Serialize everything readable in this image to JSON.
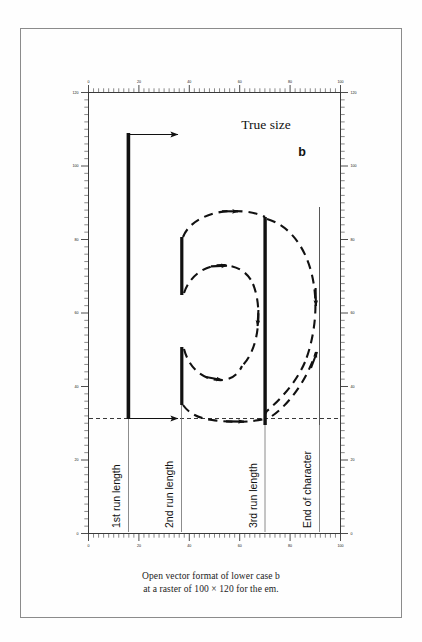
{
  "document": {
    "kind": "figure-page",
    "caption_line_1": "Open vector format of lower case b",
    "caption_line_2": "at a raster of 100 × 120 for the em."
  },
  "figure": {
    "annotations": {
      "true_size": "True size",
      "glyph_sample": "b"
    },
    "run_labels": [
      "1st run length",
      "2nd run length",
      "3rd run length",
      "End of character"
    ],
    "colors": {
      "ink": "#111111",
      "rule": "#3a3a3a",
      "frame": "#8b8b8b",
      "guide": "#6f6f6f",
      "paper": "#fefefe"
    }
  },
  "chart_data": {
    "type": "diagram",
    "title": "Open vector format of lower case b",
    "subtitle": "at a raster of 100 × 120 for the em.",
    "xlabel": "",
    "ylabel": "",
    "grid": false,
    "legend_position": "none",
    "raster": {
      "em_width": 100,
      "em_height": 120
    },
    "axis": {
      "x_range": [
        0,
        100
      ],
      "y_range": [
        0,
        120
      ],
      "x_major_step": 20,
      "x_minor_step": 2,
      "y_major_step": 20,
      "y_minor_step": 2,
      "x_tick_labels": [
        "0",
        "20",
        "40",
        "60",
        "80",
        "100"
      ],
      "y_tick_labels": [
        "0",
        "20",
        "40",
        "60",
        "80",
        "100",
        "120"
      ],
      "rulers": [
        "top",
        "bottom",
        "left",
        "right"
      ]
    },
    "baseline_y": 0,
    "strokes": [
      {
        "name": "1st run length",
        "kind": "stem",
        "x": 10,
        "y_from": 0,
        "y_to": 100,
        "weight": "thick"
      },
      {
        "name": "2nd run length upper",
        "kind": "stem",
        "x": 30,
        "y_from": 66,
        "y_to": 86,
        "weight": "medium"
      },
      {
        "name": "2nd run length lower",
        "kind": "stem",
        "x": 30,
        "y_from": 5,
        "y_to": 25,
        "weight": "medium"
      },
      {
        "name": "3rd run length",
        "kind": "stem",
        "x": 62,
        "y_from": 0,
        "y_to": 73,
        "weight": "thick"
      },
      {
        "name": "End of character",
        "kind": "guide",
        "x": 83,
        "y_from": 0,
        "y_to": 77,
        "weight": "thin"
      }
    ],
    "arcs": [
      {
        "name": "outer bowl top",
        "direction": "left-to-right"
      },
      {
        "name": "outer bowl right",
        "direction": "top-to-bottom"
      },
      {
        "name": "outer bowl bottom",
        "direction": "left-to-right"
      },
      {
        "name": "inner counter top",
        "direction": "left-to-right"
      },
      {
        "name": "inner counter right",
        "direction": "top-to-bottom"
      },
      {
        "name": "inner counter bottom",
        "direction": "left-to-right"
      },
      {
        "name": "return to origin",
        "direction": "bottom-to-top"
      }
    ],
    "arrows": [
      {
        "name": "top run arrow",
        "from_x": 10,
        "from_y": 100,
        "to_x": 31,
        "to_y": 100
      },
      {
        "name": "baseline run arrow",
        "from_x": 10,
        "from_y": 0,
        "to_x": 31,
        "to_y": 0
      }
    ]
  }
}
